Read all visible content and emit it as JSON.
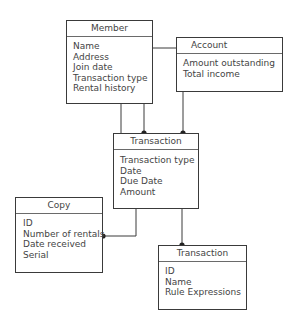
{
  "diagram": {
    "entities": [
      {
        "id": "member",
        "title": "Member",
        "attributes": [
          "Name",
          "Address",
          "Join date",
          "Transaction type",
          "Rental history"
        ]
      },
      {
        "id": "account",
        "title": "Account",
        "attributes": [
          "Amount outstanding",
          "Total income"
        ]
      },
      {
        "id": "transaction",
        "title": "Transaction",
        "attributes": [
          "Transaction type",
          "Date",
          "Due Date",
          "Amount"
        ]
      },
      {
        "id": "copy",
        "title": "Copy",
        "attributes": [
          "ID",
          "Number of rentals",
          "Date received",
          "Serial"
        ]
      },
      {
        "id": "transaction-2",
        "title": "Transaction",
        "attributes": [
          "ID",
          "Name",
          "Rule Expressions"
        ]
      }
    ],
    "relationships": [
      {
        "from": "member",
        "to": "account"
      },
      {
        "from": "member",
        "to": "transaction"
      },
      {
        "from": "member",
        "to": "transaction"
      },
      {
        "from": "account",
        "to": "transaction"
      },
      {
        "from": "transaction",
        "to": "copy"
      },
      {
        "from": "transaction",
        "to": "transaction-2"
      }
    ],
    "colors": {
      "line": "#3a3a3a",
      "text": "#444444"
    }
  }
}
